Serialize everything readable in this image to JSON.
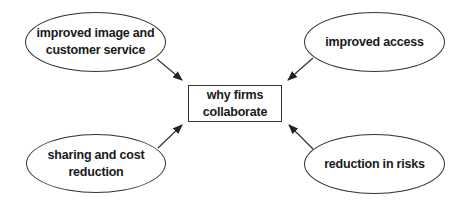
{
  "diagram": {
    "center": {
      "label": "why firms\ncollaborate"
    },
    "nodes": [
      {
        "id": "top-left",
        "label": "improved image and\ncustomer service"
      },
      {
        "id": "top-right",
        "label": "improved access"
      },
      {
        "id": "bottom-left",
        "label": "sharing and cost\nreduction"
      },
      {
        "id": "bottom-right",
        "label": "reduction in risks"
      }
    ],
    "edges": [
      {
        "from": "top-left",
        "to": "center"
      },
      {
        "from": "top-right",
        "to": "center"
      },
      {
        "from": "bottom-left",
        "to": "center"
      },
      {
        "from": "bottom-right",
        "to": "center"
      }
    ],
    "colors": {
      "stroke": "#333333",
      "text": "#1a1a1a",
      "background": "#ffffff"
    }
  }
}
